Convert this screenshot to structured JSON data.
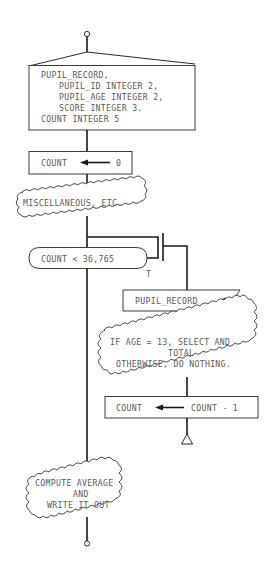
{
  "diagram": {
    "type": "structured-flowchart",
    "declaration": {
      "lines": [
        "PUPIL_RECORD,",
        "PUPIL_ID INTEGER 2,",
        "PUPIL_AGE INTEGER 2,",
        "SCORE INTEGER 3.",
        "COUNT INTEGER 5"
      ]
    },
    "init": {
      "target": "COUNT",
      "value": "0"
    },
    "misc": {
      "label": "MISCELLANEOUS, ETC."
    },
    "loop": {
      "condition": "COUNT < 36,765",
      "true_label": "T"
    },
    "read": {
      "label": "PUPIL_RECORD"
    },
    "select": {
      "lines": [
        "IF AGE = 13, SELECT AND",
        "TOTAL",
        "OTHERWISE, DO NOTHING."
      ]
    },
    "decrement": {
      "target": "COUNT",
      "expr": "COUNT - 1"
    },
    "final": {
      "lines": [
        "COMPUTE AVERAGE",
        "AND",
        "WRITE IT OUT"
      ]
    },
    "colors": {
      "line": "#2a2a2a",
      "text": "#5a5a5a",
      "background": "#ffffff"
    }
  }
}
